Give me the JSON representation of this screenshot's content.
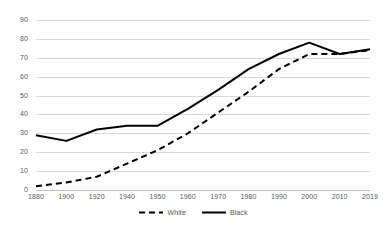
{
  "chart_data": {
    "type": "line",
    "title": "",
    "subtitle": "",
    "xlabel": "",
    "ylabel": "",
    "categories": [
      "1880",
      "1900",
      "1920",
      "1940",
      "1950",
      "1960",
      "1970",
      "1980",
      "1990",
      "2000",
      "2010",
      "2019"
    ],
    "series": [
      {
        "name": "White",
        "style": "dashed",
        "color": "#000000",
        "values": [
          2,
          4,
          7,
          14,
          21,
          30,
          41,
          52,
          64,
          72,
          72,
          74
        ]
      },
      {
        "name": "Black",
        "style": "solid",
        "color": "#000000",
        "values": [
          29,
          26,
          32,
          34,
          34,
          43,
          53,
          64,
          72,
          78,
          72,
          74.5
        ]
      }
    ],
    "ylim": [
      0,
      90
    ],
    "ytick_step": 10,
    "yticks": [
      "0",
      "10",
      "20",
      "30",
      "40",
      "50",
      "60",
      "70",
      "80",
      "90"
    ],
    "grid": true,
    "grid_axis": "y",
    "grid_color": "#d9d9d9",
    "legend_position": "bottom",
    "legend": [
      {
        "label": "White",
        "style": "dashed"
      },
      {
        "label": "Black",
        "style": "solid"
      }
    ]
  }
}
